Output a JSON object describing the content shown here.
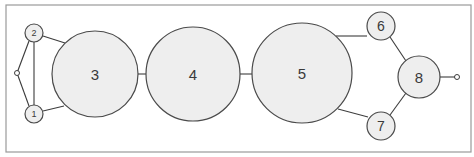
{
  "diagram": {
    "type": "network",
    "frame": {
      "x": 6,
      "y": 5,
      "width": 465,
      "height": 147,
      "stroke": "#9a9a9a",
      "fill": "#ffffff"
    },
    "style": {
      "node_fill": "#eeeeee",
      "node_stroke": "#4a4a4a",
      "edge_stroke": "#3c3c3c",
      "label_color": "#3a3a3a"
    },
    "terminals": [
      {
        "id": "in",
        "cx": 17,
        "cy": 73,
        "r": 2.5
      },
      {
        "id": "out",
        "cx": 457,
        "cy": 77,
        "r": 2.5
      }
    ],
    "nodes": [
      {
        "id": "1",
        "label": "1",
        "cx": 34,
        "cy": 114,
        "r": 9,
        "font": 9
      },
      {
        "id": "2",
        "label": "2",
        "cx": 34,
        "cy": 33,
        "r": 9,
        "font": 9
      },
      {
        "id": "3",
        "label": "3",
        "cx": 95,
        "cy": 74,
        "r": 43,
        "font": 15
      },
      {
        "id": "4",
        "label": "4",
        "cx": 193,
        "cy": 74,
        "r": 47,
        "font": 15
      },
      {
        "id": "5",
        "label": "5",
        "cx": 302,
        "cy": 73,
        "r": 50,
        "font": 15
      },
      {
        "id": "6",
        "label": "6",
        "cx": 381,
        "cy": 26,
        "r": 14,
        "font": 14
      },
      {
        "id": "7",
        "label": "7",
        "cx": 381,
        "cy": 126,
        "r": 14,
        "font": 14
      },
      {
        "id": "8",
        "label": "8",
        "cx": 419,
        "cy": 77,
        "r": 21,
        "font": 15
      }
    ],
    "edges": [
      {
        "from": "in",
        "to": "2",
        "x1": 17,
        "y1": 73,
        "x2": 29,
        "y2": 41
      },
      {
        "from": "in",
        "to": "1",
        "x1": 17,
        "y1": 73,
        "x2": 29,
        "y2": 106
      },
      {
        "from": "2",
        "to": "1",
        "x1": 34,
        "y1": 42,
        "x2": 34,
        "y2": 105
      },
      {
        "from": "2",
        "to": "3",
        "x1": 43,
        "y1": 36,
        "x2": 65,
        "y2": 43
      },
      {
        "from": "1",
        "to": "3",
        "x1": 43,
        "y1": 111,
        "x2": 64,
        "y2": 106
      },
      {
        "from": "3",
        "to": "4",
        "x1": 138,
        "y1": 74,
        "x2": 146,
        "y2": 74
      },
      {
        "from": "4",
        "to": "5",
        "x1": 240,
        "y1": 74,
        "x2": 252,
        "y2": 74
      },
      {
        "from": "5",
        "to": "6",
        "x1": 336,
        "y1": 36,
        "x2": 367,
        "y2": 36
      },
      {
        "from": "5",
        "to": "7",
        "x1": 338,
        "y1": 109,
        "x2": 368,
        "y2": 117
      },
      {
        "from": "6",
        "to": "8",
        "x1": 390,
        "y1": 37,
        "x2": 406,
        "y2": 61
      },
      {
        "from": "7",
        "to": "8",
        "x1": 390,
        "y1": 115,
        "x2": 406,
        "y2": 93
      },
      {
        "from": "8",
        "to": "out",
        "x1": 440,
        "y1": 77,
        "x2": 455,
        "y2": 77
      }
    ]
  }
}
